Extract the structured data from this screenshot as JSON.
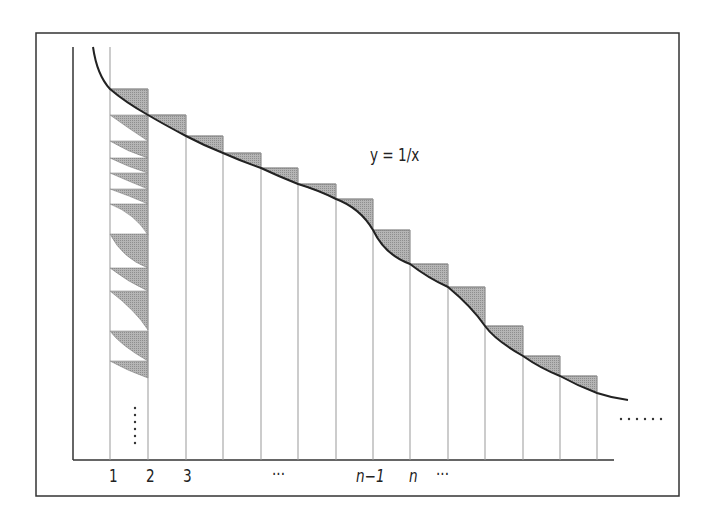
{
  "figure": {
    "curve_label": "y = 1/x",
    "x_tick_labels": [
      "1",
      "2",
      "3",
      "···",
      "n−1",
      "n",
      "···"
    ],
    "continuation_dots_bottom_right": "······",
    "continuation_dots_column1": "vertical dots",
    "colors": {
      "frame": "#333333",
      "curve": "#222222",
      "shaded_fill": "#a9a9a9",
      "grid_lines": "#9a9a9a"
    }
  }
}
